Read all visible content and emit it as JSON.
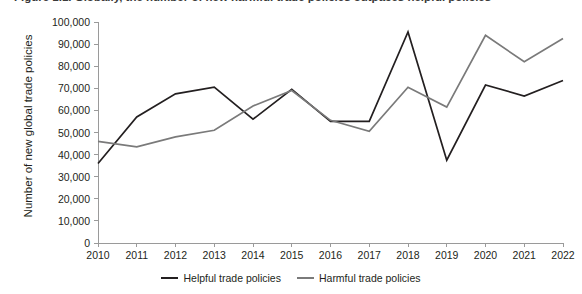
{
  "figure": {
    "title": "Figure 1.1. Globally, the number of new harmful trade policies outpaces helpful policies"
  },
  "chart_data": {
    "type": "line",
    "title": "",
    "xlabel": "",
    "ylabel": "Number of new global trade policies",
    "x": [
      "2010",
      "2011",
      "2012",
      "2013",
      "2014",
      "2015",
      "2016",
      "2017",
      "2018",
      "2019",
      "2020",
      "2021",
      "2022"
    ],
    "xlim": [
      2010,
      2022
    ],
    "ylim": [
      0,
      100000
    ],
    "yticks": [
      0,
      10000,
      20000,
      30000,
      40000,
      50000,
      60000,
      70000,
      80000,
      90000,
      100000
    ],
    "ytick_labels": [
      "0",
      "10,000",
      "20,000",
      "30,000",
      "40,000",
      "50,000",
      "60,000",
      "70,000",
      "80,000",
      "90,000",
      "100,000"
    ],
    "grid": false,
    "legend_position": "bottom",
    "series": [
      {
        "name": "Helpful trade policies",
        "color": "#231f20",
        "values": [
          36000,
          57000,
          67500,
          70500,
          56000,
          69500,
          55000,
          55000,
          95500,
          37500,
          71500,
          66500,
          73500
        ]
      },
      {
        "name": "Harmful trade policies",
        "color": "#7a7a7a",
        "values": [
          46000,
          43500,
          48000,
          51000,
          62000,
          69000,
          55500,
          50500,
          70500,
          61500,
          94000,
          82000,
          92500
        ]
      }
    ]
  },
  "axis": {
    "y_title": "Number of new global trade policies"
  }
}
